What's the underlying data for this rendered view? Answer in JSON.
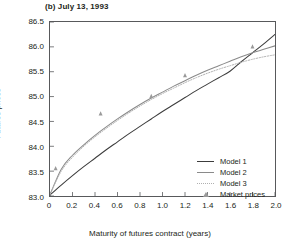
{
  "panel": {
    "title": "(b) July 13, 1993"
  },
  "axes": {
    "xlabel": "Maturity of futures contract (years)",
    "ylabel": "Futures prices",
    "xticks": [
      "0",
      "0.2",
      "0.4",
      "0.6",
      "0.8",
      "1.0",
      "1.2",
      "1.4",
      "1.6",
      "1.8",
      "2.0"
    ],
    "yticks": [
      "83.0",
      "83.5",
      "84.0",
      "84.5",
      "85.0",
      "85.5",
      "86.0",
      "86.5"
    ]
  },
  "legend": {
    "items": [
      {
        "label": "Model 1",
        "style": "solid-dark",
        "color": "#3c3c3c"
      },
      {
        "label": "Model 2",
        "style": "solid-mid",
        "color": "#8a8a8a"
      },
      {
        "label": "Model 3",
        "style": "dotted",
        "color": "#b0b0b0"
      },
      {
        "label": "Market prices",
        "style": "triangle-marker",
        "color": "#9a9a9a"
      }
    ]
  },
  "chart_data": {
    "type": "line",
    "title": "(b) July 13, 1993",
    "xlabel": "Maturity of futures contract (years)",
    "ylabel": "Futures prices",
    "xlim": [
      0.0,
      2.0
    ],
    "ylim": [
      83.0,
      86.5
    ],
    "grid": false,
    "legend_position": "bottom-right",
    "series": [
      {
        "name": "Model 1",
        "style": "solid",
        "color": "#3c3c3c",
        "x": [
          0.0,
          0.1,
          0.2,
          0.3,
          0.4,
          0.5,
          0.6,
          0.7,
          0.8,
          0.9,
          1.0,
          1.1,
          1.2,
          1.3,
          1.4,
          1.5,
          1.6,
          1.7,
          1.8,
          1.9,
          2.0
        ],
        "y": [
          83.02,
          83.22,
          83.41,
          83.59,
          83.76,
          83.93,
          84.09,
          84.25,
          84.4,
          84.55,
          84.7,
          84.84,
          84.98,
          85.12,
          85.25,
          85.38,
          85.51,
          85.7,
          85.88,
          86.06,
          86.25
        ]
      },
      {
        "name": "Model 2",
        "style": "solid",
        "color": "#8a8a8a",
        "x": [
          0.0,
          0.1,
          0.2,
          0.3,
          0.4,
          0.5,
          0.6,
          0.7,
          0.8,
          0.9,
          1.0,
          1.1,
          1.2,
          1.3,
          1.4,
          1.5,
          1.6,
          1.7,
          1.8,
          1.9,
          2.0
        ],
        "y": [
          83.03,
          83.54,
          83.82,
          84.03,
          84.22,
          84.39,
          84.55,
          84.7,
          84.84,
          84.97,
          85.09,
          85.21,
          85.32,
          85.43,
          85.53,
          85.62,
          85.71,
          85.8,
          85.88,
          85.95,
          86.02
        ]
      },
      {
        "name": "Model 3",
        "style": "dotted",
        "color": "#b0b0b0",
        "x": [
          0.0,
          0.1,
          0.2,
          0.3,
          0.4,
          0.5,
          0.6,
          0.7,
          0.8,
          0.9,
          1.0,
          1.1,
          1.2,
          1.3,
          1.4,
          1.5,
          1.6,
          1.7,
          1.8,
          1.9,
          2.0
        ],
        "y": [
          83.03,
          83.5,
          83.78,
          84.0,
          84.19,
          84.36,
          84.52,
          84.67,
          84.81,
          84.94,
          85.06,
          85.17,
          85.28,
          85.38,
          85.47,
          85.55,
          85.62,
          85.69,
          85.75,
          85.8,
          85.84
        ]
      },
      {
        "name": "Market prices",
        "style": "markers",
        "marker": "triangle",
        "color": "#9a9a9a",
        "x": [
          0.05,
          0.45,
          0.9,
          1.2,
          1.8
        ],
        "y": [
          83.55,
          84.65,
          85.0,
          85.42,
          86.0
        ]
      }
    ]
  }
}
